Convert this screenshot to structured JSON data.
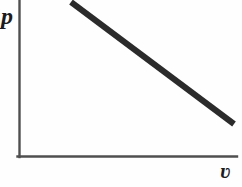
{
  "figure": {
    "background_color": "#fefefe"
  },
  "axes": {
    "y_label": "p",
    "x_label": "ʋ",
    "axis_color": "#4f4f4f",
    "axis_width_px": 2,
    "origin": {
      "x": 19,
      "y": 157
    },
    "y_axis_top": {
      "x": 19,
      "y": 0
    },
    "x_axis_right": {
      "x": 237,
      "y": 157
    }
  },
  "chart_data": {
    "type": "line",
    "title": "",
    "xlabel": "ʋ",
    "ylabel": "p",
    "grid": false,
    "legend": null,
    "xlim": [
      0,
      1
    ],
    "ylim": [
      0,
      1
    ],
    "series": [
      {
        "name": "p vs v",
        "color": "#2b2b2b",
        "line_width_px": 6,
        "x": [
          0.239,
          0.986
        ],
        "y": [
          0.987,
          0.21
        ],
        "points_px": [
          {
            "x": 71,
            "y": 2
          },
          {
            "x": 234,
            "y": 124
          }
        ],
        "description": "straight line decreasing from upper-left to lower-right"
      }
    ]
  }
}
